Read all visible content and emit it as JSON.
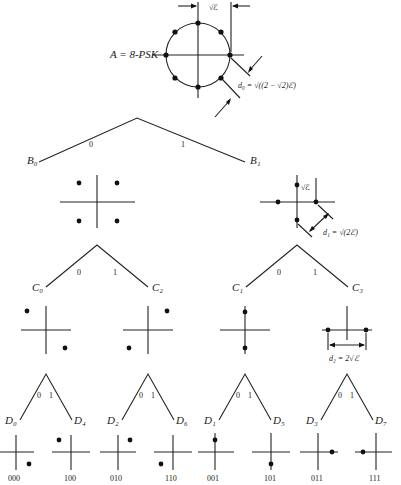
{
  "root": {
    "label": "A = 8-PSK",
    "spacing_label": "√ℰ",
    "distance_label": "d₀ = √((2 − √2)ℰ)"
  },
  "level1": {
    "branch_labels": [
      "0",
      "1"
    ],
    "nodes": [
      "B₀",
      "B₁"
    ],
    "spacing_label": "√ℰ",
    "distance_label": "d₁ = √(2ℰ)"
  },
  "level2": {
    "branch_labels": [
      "0",
      "1",
      "0",
      "1"
    ],
    "nodes": [
      "C₀",
      "C₂",
      "C₁",
      "C₃"
    ],
    "distance_label": "d₂ = 2√ℰ"
  },
  "level3": {
    "branch_labels": [
      "0",
      "1",
      "0",
      "1",
      "0",
      "1",
      "0",
      "1"
    ],
    "nodes": [
      "D₀",
      "D₄",
      "D₂",
      "D₆",
      "D₁",
      "D₅",
      "D₃",
      "D₇"
    ],
    "codes": [
      "000",
      "100",
      "010",
      "110",
      "001",
      "101",
      "011",
      "111"
    ]
  }
}
